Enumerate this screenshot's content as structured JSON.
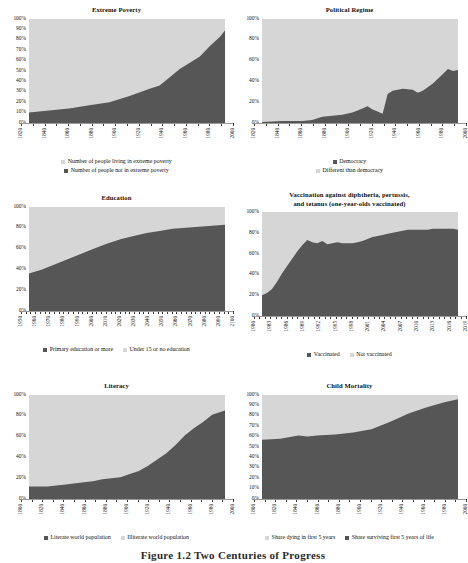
{
  "figure": {
    "caption": "Figure 1.2  Two Centuries of Progress",
    "colors": {
      "light": "#d6d6d6",
      "dark": "#565656",
      "plot_bg": "#d6d6d6",
      "text": "#111111"
    }
  },
  "charts": [
    {
      "id": "extreme-poverty",
      "chart_data": {
        "type": "area",
        "title": "Extreme Poverty",
        "xlabel": "",
        "ylabel": "",
        "ylim": [
          0,
          100
        ],
        "ytick_labels": [
          "100%",
          "90%",
          "80%",
          "70%",
          "60%",
          "50%",
          "40%",
          "30%",
          "20%",
          "10%",
          "0%"
        ],
        "xlim": [
          1820,
          2015
        ],
        "xtick_labels": [
          "1820",
          "1840",
          "1860",
          "1880",
          "1900",
          "1920",
          "1940",
          "1960",
          "1980",
          "2000"
        ],
        "grid": false,
        "legend_position": "below-stacked",
        "stacked_to_100": true,
        "x": [
          1820,
          1840,
          1860,
          1880,
          1900,
          1920,
          1940,
          1950,
          1960,
          1970,
          1980,
          1990,
          2000,
          2010,
          2015
        ],
        "series": [
          {
            "name": "Number of people not in extreme poverty",
            "color": "#565656",
            "values": [
              10,
              12,
              14,
              17,
              20,
              26,
              33,
              36,
              44,
              52,
              58,
              64,
              74,
              83,
              89
            ]
          },
          {
            "name": "Number of people living in extreme poverty",
            "color": "#d6d6d6",
            "values": [
              90,
              88,
              86,
              83,
              80,
              74,
              67,
              64,
              56,
              48,
              42,
              36,
              26,
              17,
              11
            ]
          }
        ],
        "legend": [
          {
            "label": "Number of people living in extreme poverty",
            "color": "#d6d6d6"
          },
          {
            "label": "Number of people not in extreme poverty",
            "color": "#565656"
          }
        ]
      }
    },
    {
      "id": "political-regime",
      "chart_data": {
        "type": "area",
        "title": "Political Regime",
        "xlabel": "",
        "ylabel": "",
        "ylim": [
          0,
          100
        ],
        "ytick_labels": [
          "100%",
          "80%",
          "60%",
          "40%",
          "20%",
          "0%"
        ],
        "xlim": [
          1820,
          2015
        ],
        "xtick_labels": [
          "1820",
          "1840",
          "1860",
          "1880",
          "1900",
          "1920",
          "1940",
          "1960",
          "1980",
          "2000"
        ],
        "grid": false,
        "legend_position": "below-stacked",
        "stacked_to_100": true,
        "x": [
          1820,
          1840,
          1850,
          1860,
          1870,
          1880,
          1890,
          1900,
          1910,
          1920,
          1925,
          1930,
          1935,
          1940,
          1945,
          1950,
          1960,
          1970,
          1975,
          1980,
          1990,
          2000,
          2005,
          2010,
          2015
        ],
        "series": [
          {
            "name": "Democracy",
            "color": "#565656",
            "values": [
              1,
              2,
              2,
              2,
              3,
              6,
              7,
              8,
              10,
              14,
              16,
              13,
              11,
              9,
              28,
              31,
              33,
              32,
              29,
              31,
              38,
              47,
              52,
              50,
              51
            ]
          },
          {
            "name": "Different than democracy",
            "color": "#d6d6d6",
            "values": [
              99,
              98,
              98,
              98,
              97,
              94,
              93,
              92,
              90,
              86,
              84,
              87,
              89,
              91,
              72,
              69,
              67,
              68,
              71,
              69,
              62,
              53,
              48,
              50,
              49
            ]
          }
        ],
        "legend": [
          {
            "label": "Democracy",
            "color": "#565656"
          },
          {
            "label": "Different than democracy",
            "color": "#d6d6d6"
          }
        ]
      }
    },
    {
      "id": "education",
      "chart_data": {
        "type": "area",
        "title": "Education",
        "xlabel": "",
        "ylabel": "",
        "ylim": [
          0,
          100
        ],
        "ytick_labels": [
          "100%",
          "80%",
          "60%",
          "40%",
          "20%",
          "0%"
        ],
        "xlim": [
          1950,
          2100
        ],
        "xtick_labels": [
          "1950",
          "1960",
          "1970",
          "1980",
          "1990",
          "2000",
          "2010",
          "2020",
          "2030",
          "2040",
          "2050",
          "2060",
          "2070",
          "2080",
          "2090",
          "2100"
        ],
        "grid": false,
        "legend_position": "below-inline",
        "stacked_to_100": true,
        "x": [
          1950,
          1960,
          1970,
          1980,
          1990,
          2000,
          2010,
          2020,
          2030,
          2040,
          2050,
          2060,
          2070,
          2080,
          2090,
          2100
        ],
        "series": [
          {
            "name": "Primary education or more",
            "color": "#565656",
            "values": [
              36,
              40,
              45,
              50,
              55,
              60,
              65,
              69,
              72,
              75,
              77,
              79,
              80,
              81,
              82,
              83
            ]
          },
          {
            "name": "Under 15 or no education",
            "color": "#d6d6d6",
            "values": [
              64,
              60,
              55,
              50,
              45,
              40,
              35,
              31,
              28,
              25,
              23,
              21,
              20,
              19,
              18,
              17
            ]
          }
        ],
        "legend": [
          {
            "label": "Primary education or more",
            "color": "#565656"
          },
          {
            "label": "Under 15 or no education",
            "color": "#d6d6d6"
          }
        ]
      }
    },
    {
      "id": "vaccination",
      "chart_data": {
        "type": "area",
        "title": "Vaccination against diphtheria, pertussis, and tetanus (one-year-olds vaccinated)",
        "title_lines": [
          "Vaccination against diphtheria, pertussis,",
          "and tetanus (one-year-olds vaccinated)"
        ],
        "xlabel": "",
        "ylabel": "",
        "ylim": [
          0,
          100
        ],
        "ytick_labels": [
          "100%",
          "80%",
          "60%",
          "40%",
          "20%",
          "0%"
        ],
        "xlim": [
          1980,
          2019
        ],
        "xtick_labels": [
          "1980",
          "1983",
          "1986",
          "1989",
          "1992",
          "1995",
          "1998",
          "2001",
          "2004",
          "2007",
          "2010",
          "2013",
          "2016",
          "2019"
        ],
        "grid": false,
        "legend_position": "below-inline",
        "stacked_to_100": true,
        "x": [
          1980,
          1981,
          1982,
          1983,
          1984,
          1985,
          1986,
          1987,
          1988,
          1989,
          1990,
          1991,
          1992,
          1993,
          1994,
          1995,
          1996,
          1997,
          1998,
          1999,
          2000,
          2001,
          2002,
          2003,
          2004,
          2005,
          2006,
          2007,
          2008,
          2009,
          2010,
          2011,
          2012,
          2013,
          2014,
          2015,
          2016,
          2017,
          2018,
          2019
        ],
        "series": [
          {
            "name": "Vaccinated",
            "color": "#565656",
            "values": [
              20,
              22,
              26,
              33,
              41,
              48,
              55,
              62,
              68,
              73,
              71,
              70,
              72,
              69,
              70,
              71,
              70,
              70,
              70,
              71,
              72,
              74,
              76,
              77,
              78,
              79,
              80,
              81,
              82,
              83,
              83,
              83,
              83,
              83,
              84,
              84,
              84,
              84,
              84,
              83
            ]
          },
          {
            "name": "Not vaccinated",
            "color": "#d6d6d6",
            "values": [
              80,
              78,
              74,
              67,
              59,
              52,
              45,
              38,
              32,
              27,
              29,
              30,
              28,
              31,
              30,
              29,
              30,
              30,
              30,
              29,
              28,
              26,
              24,
              23,
              22,
              21,
              20,
              19,
              18,
              17,
              17,
              17,
              17,
              17,
              16,
              16,
              16,
              16,
              16,
              17
            ]
          }
        ],
        "legend": [
          {
            "label": "Vaccinated",
            "color": "#565656"
          },
          {
            "label": "Not vaccinated",
            "color": "#d6d6d6"
          }
        ]
      }
    },
    {
      "id": "literacy",
      "chart_data": {
        "type": "area",
        "title": "Literacy",
        "xlabel": "",
        "ylabel": "",
        "ylim": [
          0,
          100
        ],
        "ytick_labels": [
          "100%",
          "80%",
          "60%",
          "40%",
          "20%",
          "0%"
        ],
        "xlim": [
          1800,
          2014
        ],
        "xtick_labels": [
          "1800",
          "1820",
          "1840",
          "1860",
          "1880",
          "1900",
          "1920",
          "1940",
          "1960",
          "1980",
          "2000"
        ],
        "grid": false,
        "legend_position": "below-inline",
        "stacked_to_100": true,
        "x": [
          1800,
          1820,
          1840,
          1860,
          1870,
          1880,
          1890,
          1900,
          1910,
          1920,
          1930,
          1940,
          1950,
          1960,
          1970,
          1980,
          1990,
          2000,
          2014
        ],
        "series": [
          {
            "name": "Literate world population",
            "color": "#565656",
            "values": [
              12,
              12,
              14,
              16,
              17,
              19,
              20,
              21,
              24,
              27,
              32,
              38,
              44,
              52,
              61,
              68,
              74,
              81,
              85
            ]
          },
          {
            "name": "Illiterate world population",
            "color": "#d6d6d6",
            "values": [
              88,
              88,
              86,
              84,
              83,
              81,
              80,
              79,
              76,
              73,
              68,
              62,
              56,
              48,
              39,
              32,
              26,
              19,
              15
            ]
          }
        ],
        "legend": [
          {
            "label": "Literate world population",
            "color": "#565656"
          },
          {
            "label": "Illiterate world population",
            "color": "#d6d6d6"
          }
        ]
      }
    },
    {
      "id": "child-mortality",
      "chart_data": {
        "type": "area",
        "title": "Child Mortality",
        "xlabel": "",
        "ylabel": "",
        "ylim": [
          0,
          100
        ],
        "ytick_labels": [
          "100%",
          "90%",
          "80%",
          "70%",
          "60%",
          "50%",
          "40%",
          "30%",
          "20%",
          "10%",
          "0%"
        ],
        "xlim": [
          1800,
          2015
        ],
        "xtick_labels": [
          "1800",
          "1820",
          "1840",
          "1860",
          "1880",
          "1900",
          "1920",
          "1940",
          "1960",
          "1980",
          "2000"
        ],
        "grid": false,
        "legend_position": "below-inline",
        "stacked_to_100": true,
        "x": [
          1800,
          1820,
          1840,
          1850,
          1860,
          1880,
          1900,
          1920,
          1940,
          1950,
          1960,
          1980,
          2000,
          2015
        ],
        "series": [
          {
            "name": "Share surviving first 5 years of life",
            "color": "#565656",
            "values": [
              57,
              58,
              61,
              60,
              61,
              62,
              64,
              67,
              74,
              78,
              82,
              88,
              93,
              96
            ]
          },
          {
            "name": "Share dying in first 5 years",
            "color": "#d6d6d6",
            "values": [
              43,
              42,
              39,
              40,
              39,
              38,
              36,
              33,
              26,
              22,
              18,
              12,
              7,
              4
            ]
          }
        ],
        "legend": [
          {
            "label": "Share dying in first 5 years",
            "color": "#d6d6d6"
          },
          {
            "label": "Share surviving first 5 years of life",
            "color": "#565656"
          }
        ]
      }
    }
  ]
}
